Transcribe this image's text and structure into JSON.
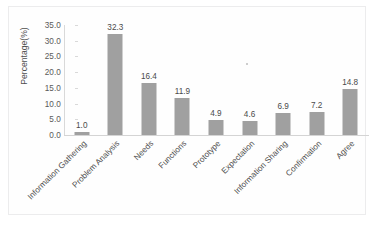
{
  "chart_data": {
    "type": "bar",
    "title": "",
    "xlabel": "",
    "ylabel": "Percentage(%)",
    "ylim": [
      0,
      35
    ],
    "ytick_step": 5,
    "grid": false,
    "legend": null,
    "bar_color": "#a0a0a0",
    "categories": [
      "Information Gathering",
      "Problem Analysis",
      "Needs",
      "Functions",
      "Prototype",
      "Expectation",
      "Information Sharing",
      "Confirmation",
      "Agree"
    ],
    "values": [
      1.0,
      32.3,
      16.4,
      11.9,
      4.9,
      4.6,
      6.9,
      7.2,
      14.8
    ],
    "value_labels": [
      "1.0",
      "32.3",
      "16.4",
      "11.9",
      "4.9",
      "4.6",
      "6.9",
      "7.2",
      "14.8"
    ],
    "ytick_labels": [
      "0.0",
      "5.0",
      "10.0",
      "15.0",
      "20.0",
      "25.0",
      "30.0",
      "35.0"
    ],
    "ytick_values": [
      0,
      5,
      10,
      15,
      20,
      25,
      30,
      35
    ]
  }
}
